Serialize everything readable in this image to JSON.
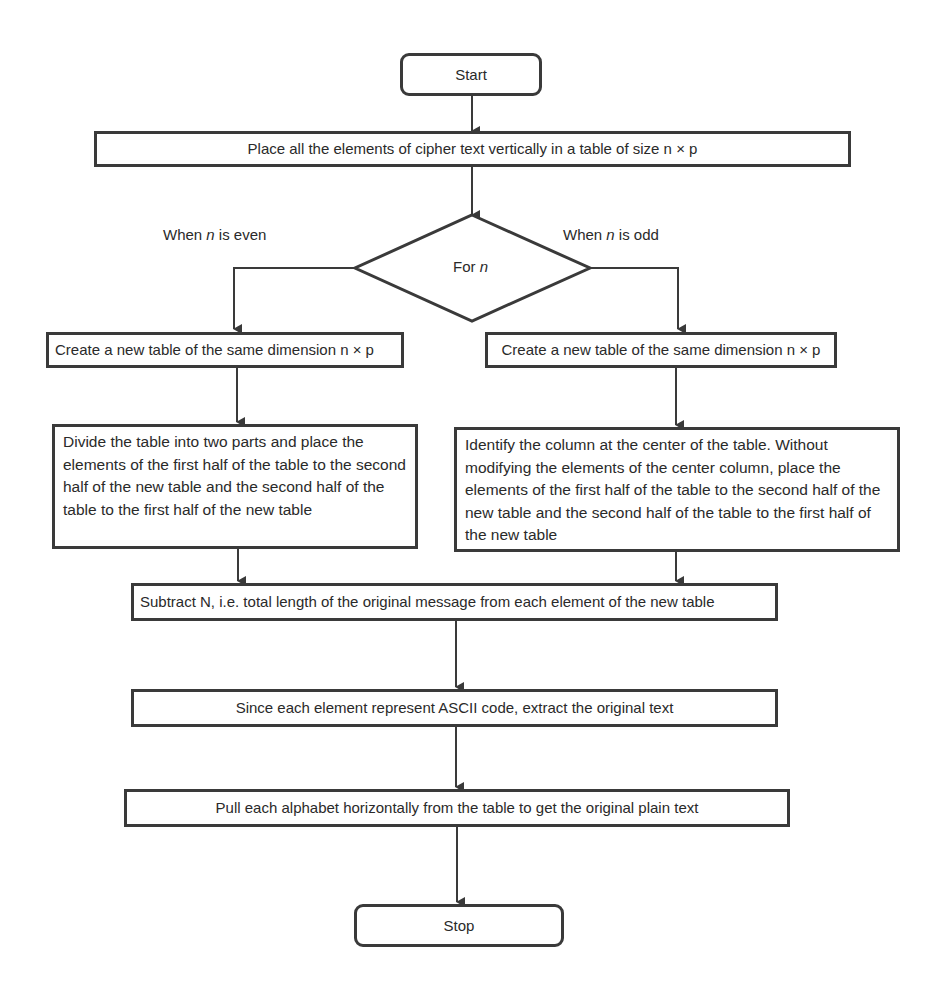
{
  "flowchart": {
    "start": "Start",
    "step_place": "Place all the elements of cipher text vertically in a table of size n × p",
    "decision": {
      "prefix": "For ",
      "var": "n"
    },
    "branch_even": {
      "prefix": "When ",
      "var": "n",
      "suffix": " is even"
    },
    "branch_odd": {
      "prefix": "When ",
      "var": "n",
      "suffix": " is odd"
    },
    "even_create": "Create a new table of the same dimension n × p",
    "odd_create": "Create a new table of the same dimension n × p",
    "even_divide": "Divide the table into two parts and place the elements of the first half of the table to the second half of the new table and the second half of the table to the first half of the new table",
    "odd_identify": "Identify the column at the center of the table. Without modifying the elements of the center column, place the elements of the first half of the table to the second half of the new table and the second half of the table to the first half of the new table",
    "subtract": "Subtract N, i.e. total length of the original message from each element of the new table",
    "ascii": "Since each element represent ASCII code, extract the original text",
    "pull": "Pull each alphabet horizontally from the table to get the original plain text",
    "stop": "Stop"
  },
  "colors": {
    "stroke": "#3a3a3a",
    "text": "#2a2a2a",
    "background": "#ffffff"
  }
}
